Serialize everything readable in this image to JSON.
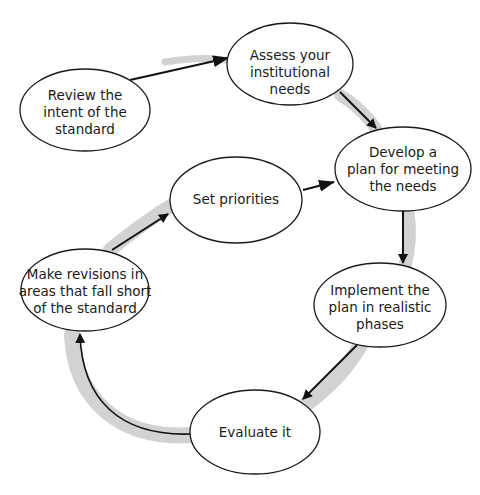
{
  "diagram": {
    "type": "cycle-flow",
    "colors": {
      "background": "#ffffff",
      "node_fill": "#ffffff",
      "node_stroke": "#1a1a1a",
      "arrow": "#111111",
      "cycle_band": "#d2d2d2"
    },
    "nodes": [
      {
        "id": "review",
        "lines": [
          "Review the",
          "intent of the",
          "standard"
        ]
      },
      {
        "id": "assess",
        "lines": [
          "Assess your",
          "institutional",
          "needs"
        ]
      },
      {
        "id": "develop",
        "lines": [
          "Develop a",
          "plan for meeting",
          "the needs"
        ]
      },
      {
        "id": "implement",
        "lines": [
          "Implement the",
          "plan in realistic",
          "phases"
        ]
      },
      {
        "id": "evaluate",
        "lines": [
          "Evaluate it"
        ]
      },
      {
        "id": "revise",
        "lines": [
          "Make revisions in",
          "areas that fall short",
          "of the standard"
        ]
      },
      {
        "id": "priorities",
        "lines": [
          "Set priorities"
        ]
      }
    ],
    "edges": [
      {
        "from": "review",
        "to": "assess"
      },
      {
        "from": "assess",
        "to": "develop"
      },
      {
        "from": "develop",
        "to": "implement"
      },
      {
        "from": "implement",
        "to": "evaluate"
      },
      {
        "from": "evaluate",
        "to": "revise"
      },
      {
        "from": "revise",
        "to": "priorities"
      },
      {
        "from": "priorities",
        "to": "develop"
      }
    ]
  }
}
